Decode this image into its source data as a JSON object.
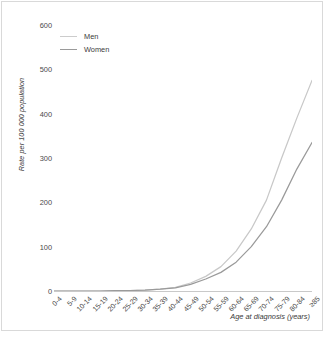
{
  "axes": {
    "ylabel": "Rate per 100 000 population",
    "xlabel": "Age at diagnosis (years)"
  },
  "legend": {
    "men": "Men",
    "women": "Women"
  },
  "chart_data": {
    "type": "line",
    "title": "",
    "xlabel": "Age at diagnosis (years)",
    "ylabel": "Rate per 100 000 population",
    "ylim": [
      0,
      600
    ],
    "yticks": [
      0,
      100,
      200,
      300,
      400,
      500,
      600
    ],
    "grid": false,
    "legend_position": "top-left-inside",
    "categories": [
      "0-4",
      "5-9",
      "10-14",
      "15-19",
      "20-24",
      "25-29",
      "30-34",
      "35-39",
      "40-44",
      "45-49",
      "50-54",
      "55-59",
      "60-64",
      "65-69",
      "70-74",
      "75-79",
      "80-84",
      "≥85"
    ],
    "series": [
      {
        "name": "Men",
        "color": "#c8c8c8",
        "values": [
          0,
          0,
          0,
          0,
          1,
          1,
          2,
          4,
          8,
          18,
          33,
          55,
          90,
          140,
          205,
          300,
          390,
          475
        ]
      },
      {
        "name": "Women",
        "color": "#9a9a9a",
        "values": [
          0,
          0,
          0,
          0,
          1,
          1,
          2,
          4,
          7,
          15,
          27,
          42,
          65,
          100,
          145,
          205,
          275,
          335
        ]
      }
    ]
  },
  "colors": {
    "men_line": "#c8c8c8",
    "women_line": "#9a9a9a",
    "axis": "#c9c9c9",
    "text": "#4a4a4a",
    "border": "#d9d9d9"
  }
}
